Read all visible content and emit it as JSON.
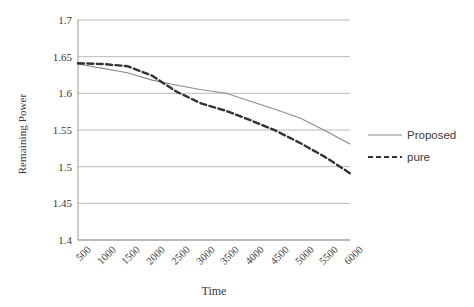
{
  "chart_data": {
    "type": "line",
    "title": "",
    "xlabel": "Time",
    "ylabel": "Remaining Power",
    "x": [
      500,
      1000,
      1500,
      2000,
      2500,
      3000,
      3500,
      4000,
      4500,
      5000,
      5500,
      6000
    ],
    "categories": [
      "500",
      "1000",
      "1500",
      "2000",
      "2500",
      "3000",
      "3500",
      "4000",
      "4500",
      "5000",
      "5500",
      "6000"
    ],
    "series": [
      {
        "name": "Proposed",
        "style": "solid",
        "color": "#8c8c8c",
        "values": [
          1.64,
          1.634,
          1.628,
          1.618,
          1.611,
          1.605,
          1.6,
          1.589,
          1.578,
          1.566,
          1.549,
          1.531
        ]
      },
      {
        "name": "pure",
        "style": "dashed",
        "color": "#333333",
        "values": [
          1.641,
          1.64,
          1.637,
          1.624,
          1.602,
          1.586,
          1.576,
          1.563,
          1.549,
          1.532,
          1.513,
          1.491
        ]
      }
    ],
    "ylim": [
      1.4,
      1.7
    ],
    "yticks": [
      1.7,
      1.65,
      1.6,
      1.55,
      1.5,
      1.45,
      1.4
    ],
    "ytick_labels": [
      "1.7",
      "1.65",
      "1.6",
      "1.55",
      "1.5",
      "1.45",
      "1.4"
    ],
    "grid": "horizontal",
    "legend_position": "right",
    "axis_color": "#9a9a9a",
    "grid_color": "#a8a8a8"
  },
  "legend": {
    "items": [
      {
        "label": "Proposed"
      },
      {
        "label": "pure"
      }
    ]
  }
}
